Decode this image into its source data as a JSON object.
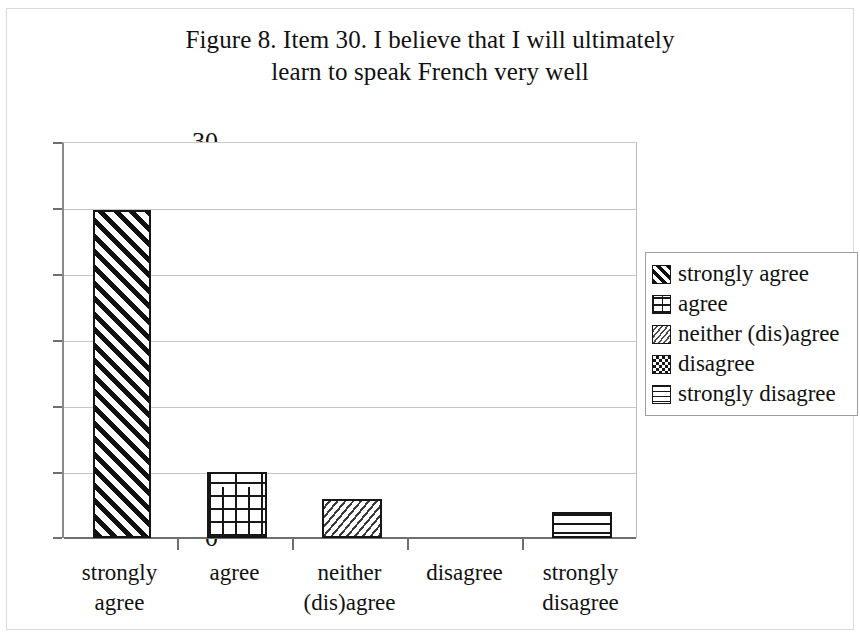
{
  "chart_data": {
    "type": "bar",
    "title": "Figure 8. Item 30. I believe that I will ultimately learn to speak French very well",
    "title_lines": [
      "Figure 8. Item 30. I believe that I will ultimately",
      "learn to speak French very well"
    ],
    "categories": [
      "strongly agree",
      "agree",
      "neither (dis)agree",
      "disagree",
      "strongly disagree"
    ],
    "category_lines": [
      [
        "strongly",
        "agree"
      ],
      [
        "agree",
        ""
      ],
      [
        "neither",
        "(dis)agree"
      ],
      [
        "disagree",
        ""
      ],
      [
        "strongly",
        "disagree"
      ]
    ],
    "values": [
      25,
      5,
      3,
      0,
      2
    ],
    "xlabel": "",
    "ylabel": "",
    "ylim": [
      0,
      30
    ],
    "yticks": [
      0,
      5,
      10,
      15,
      20,
      25,
      30
    ],
    "ytick_labels": [
      "0",
      "5",
      "10",
      "15",
      "20",
      "25",
      "30"
    ],
    "grid": true,
    "grid_axis": "y",
    "legend_position": "right",
    "legend": [
      {
        "label": "strongly agree",
        "pattern": "diagonal-hatch-thick"
      },
      {
        "label": "agree",
        "pattern": "brick"
      },
      {
        "label": "neither (dis)agree",
        "pattern": "diagonal-hatch-fine"
      },
      {
        "label": "disagree",
        "pattern": "checkerboard"
      },
      {
        "label": "strongly disagree",
        "pattern": "horizontal-lines"
      }
    ],
    "bar_fill_color": "#ffffff",
    "bar_border_color": "#161616",
    "gridline_color": "#c5c5c5",
    "axis_color": "#6f6f6f",
    "background_color": "#ffffff",
    "text_color": "#111111"
  }
}
